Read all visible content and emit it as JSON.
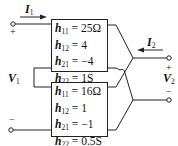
{
  "diagram": {
    "ports": {
      "input": {
        "current_label": "I",
        "current_sub": "1",
        "voltage_label": "V",
        "voltage_sub": "1",
        "plus": "+",
        "minus": "−"
      },
      "output": {
        "current_label": "I",
        "current_sub": "2",
        "voltage_label": "V",
        "voltage_sub": "2",
        "plus": "+",
        "minus": "−"
      }
    },
    "networks": [
      {
        "name": "top",
        "params": [
          {
            "sym": "h",
            "sub": "11",
            "value": " = 25Ω"
          },
          {
            "sym": "h",
            "sub": "12",
            "value": " = 4"
          },
          {
            "sym": "h",
            "sub": "21",
            "value": " = −4"
          },
          {
            "sym": "h",
            "sub": "22",
            "value": " = 1S"
          }
        ]
      },
      {
        "name": "bottom",
        "params": [
          {
            "sym": "h",
            "sub": "11",
            "value": " = 16Ω"
          },
          {
            "sym": "h",
            "sub": "12",
            "value": " = 1"
          },
          {
            "sym": "h",
            "sub": "21",
            "value": " = −1"
          },
          {
            "sym": "h",
            "sub": "22",
            "value": " = 0.5S"
          }
        ]
      }
    ],
    "colors": {
      "line": "#222222",
      "text": "#111111",
      "background": "#ffffff"
    }
  }
}
